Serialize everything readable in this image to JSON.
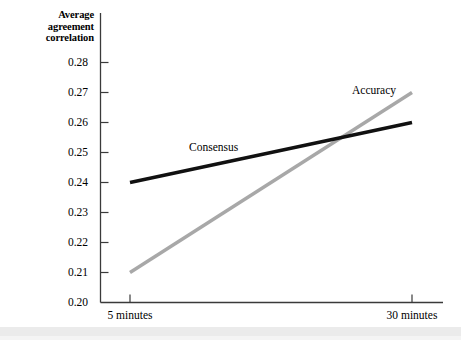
{
  "chart_data": {
    "type": "line",
    "title": "",
    "ylabel": "Average agreement correlation",
    "ylabel_lines": [
      "Average",
      "agreement",
      "correlation"
    ],
    "xlabel": "",
    "categories": [
      "5 minutes",
      "30 minutes"
    ],
    "x": [
      5,
      30
    ],
    "ylim": [
      0.2,
      0.28
    ],
    "yticks": [
      "0.20",
      "0.21",
      "0.22",
      "0.23",
      "0.24",
      "0.25",
      "0.26",
      "0.27",
      "0.28"
    ],
    "ytick_values": [
      0.2,
      0.21,
      0.22,
      0.23,
      0.24,
      0.25,
      0.26,
      0.27,
      0.28
    ],
    "xticks": [
      "5 minutes",
      "30 minutes"
    ],
    "grid": false,
    "legend_position": "inline-labels",
    "series": [
      {
        "name": "Consensus",
        "values": [
          0.24,
          0.26
        ],
        "color": "#111111",
        "width": 3.4,
        "label_x": 5,
        "label_y": 0.2535
      },
      {
        "name": "Accuracy",
        "values": [
          0.21,
          0.27
        ],
        "color": "#a8a8a8",
        "width": 3.4,
        "label_x": 30,
        "label_y": 0.2695
      }
    ],
    "annotations": [
      {
        "text": "Consensus",
        "series": "Consensus"
      },
      {
        "text": "Accuracy",
        "series": "Accuracy"
      }
    ],
    "axis_color": "#3a3a3a"
  },
  "colors": {
    "consensus": "#111111",
    "accuracy": "#a8a8a8",
    "axis": "#3a3a3a",
    "background": "#ffffff",
    "bottom_band": "#ebebeb"
  }
}
